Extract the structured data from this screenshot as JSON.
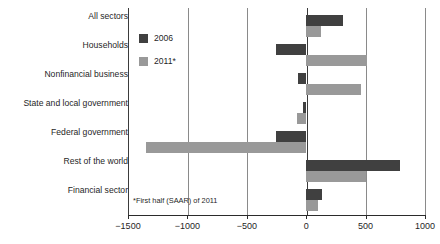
{
  "chart_data": {
    "type": "bar",
    "orientation": "horizontal",
    "title": "",
    "xlabel": "",
    "ylabel": "",
    "xlim": [
      -1500,
      1000
    ],
    "xticks": [
      -1500,
      -1000,
      -500,
      0,
      500,
      1000
    ],
    "xtick_labels": [
      "−1500",
      "−1000",
      "−500",
      "0",
      "500",
      "1000"
    ],
    "grid": true,
    "legend_position": "inside-upper-left",
    "categories": [
      "All sectors",
      "Households",
      "Nonfinancial business",
      "State and local government",
      "Federal government",
      "Rest of the world",
      "Financial sector"
    ],
    "series": [
      {
        "name": "2006",
        "color": "#404040",
        "values": [
          310,
          -255,
          -65,
          -25,
          -255,
          790,
          130
        ]
      },
      {
        "name": "2011*",
        "color": "#999999",
        "values": [
          125,
          515,
          465,
          -80,
          -1350,
          505,
          100
        ]
      }
    ],
    "annotations": [
      "*First half (SAAR) of 2011"
    ]
  },
  "legend": {
    "items": [
      {
        "label": "2006",
        "color": "#404040"
      },
      {
        "label": "2011*",
        "color": "#999999"
      }
    ]
  },
  "footnote": {
    "text": "*First half (SAAR) of 2011"
  }
}
